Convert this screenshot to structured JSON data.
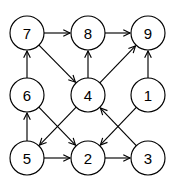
{
  "diagram": {
    "type": "directed-graph",
    "width": 175,
    "height": 184,
    "background_color": "#ffffff",
    "stroke_color": "#000000",
    "node_fill_color": "#ffffff",
    "node_radius": 17,
    "arrow_style": "open-v",
    "nodes": [
      {
        "id": "n7",
        "label": "7",
        "x": 27,
        "y": 33
      },
      {
        "id": "n8",
        "label": "8",
        "x": 88,
        "y": 33
      },
      {
        "id": "n9",
        "label": "9",
        "x": 148,
        "y": 33
      },
      {
        "id": "n6",
        "label": "6",
        "x": 27,
        "y": 95
      },
      {
        "id": "n4",
        "label": "4",
        "x": 88,
        "y": 95
      },
      {
        "id": "n1",
        "label": "1",
        "x": 148,
        "y": 95
      },
      {
        "id": "n5",
        "label": "5",
        "x": 27,
        "y": 158
      },
      {
        "id": "n2",
        "label": "2",
        "x": 88,
        "y": 158
      },
      {
        "id": "n3",
        "label": "3",
        "x": 148,
        "y": 158
      }
    ],
    "edges": [
      {
        "id": "e7-8",
        "from": "7",
        "to": "8",
        "direction": "right"
      },
      {
        "id": "e8-9",
        "from": "8",
        "to": "9",
        "direction": "right"
      },
      {
        "id": "e6-7",
        "from": "6",
        "to": "7",
        "direction": "up"
      },
      {
        "id": "e4-8",
        "from": "4",
        "to": "8",
        "direction": "up"
      },
      {
        "id": "e1-9",
        "from": "1",
        "to": "9",
        "direction": "up"
      },
      {
        "id": "e7-4",
        "from": "7",
        "to": "4",
        "direction": "down-right"
      },
      {
        "id": "e4-9",
        "from": "4",
        "to": "9",
        "direction": "up-right"
      },
      {
        "id": "e5-6",
        "from": "5",
        "to": "6",
        "direction": "up"
      },
      {
        "id": "e6-2",
        "from": "6",
        "to": "2",
        "direction": "down-right"
      },
      {
        "id": "e4-5",
        "from": "4",
        "to": "5",
        "direction": "down-left"
      },
      {
        "id": "e3-4",
        "from": "3",
        "to": "4",
        "direction": "up-left"
      },
      {
        "id": "e1-2",
        "from": "1",
        "to": "2",
        "direction": "down-left"
      },
      {
        "id": "e5-2",
        "from": "5",
        "to": "2",
        "direction": "right"
      },
      {
        "id": "e2-3",
        "from": "2",
        "to": "3",
        "direction": "right"
      }
    ]
  }
}
